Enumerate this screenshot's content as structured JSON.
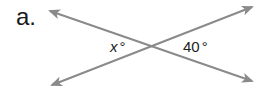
{
  "problem": {
    "label": "a."
  },
  "diagram": {
    "line_color": "#8a8a8a",
    "lines": [
      {
        "name": "line-1",
        "from": [
          48,
          10
        ],
        "to": [
          254,
          82
        ]
      },
      {
        "name": "line-2",
        "from": [
          50,
          86
        ],
        "to": [
          254,
          6
        ]
      }
    ],
    "intersection": [
      152,
      45
    ],
    "angles": [
      {
        "name": "left-angle",
        "variable": "x",
        "degree_symbol": "°",
        "text": "x°"
      },
      {
        "name": "right-angle",
        "value": "40",
        "degree_symbol": "°",
        "text": "40°"
      }
    ]
  }
}
